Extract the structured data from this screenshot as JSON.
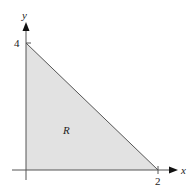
{
  "figure": {
    "region_label": "R",
    "x_axis_label": "x",
    "y_axis_label": "y",
    "x_tick_label": "2",
    "y_tick_label": "4",
    "region_fill": "#e2e2e2",
    "line_color": "#555555"
  }
}
